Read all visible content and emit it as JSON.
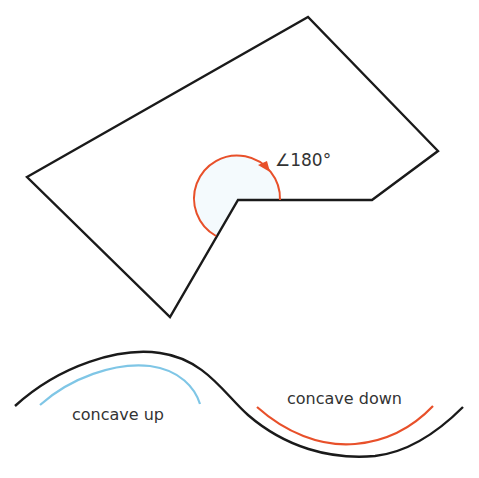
{
  "polygon": {
    "vertices": [
      [
        27,
        177
      ],
      [
        308,
        17
      ],
      [
        438,
        151
      ],
      [
        372,
        200
      ],
      [
        238,
        200
      ],
      [
        170,
        317
      ]
    ],
    "stroke": "#1a1a1a"
  },
  "angle_marker": {
    "label": "∠180°",
    "color": "#e8502a",
    "fill": "#f4fafd"
  },
  "curve": {
    "stroke": "#1a1a1a"
  },
  "concave_up": {
    "label": "concave up",
    "color": "#7fc6e6"
  },
  "concave_down": {
    "label": "concave down",
    "color": "#e8502a"
  }
}
